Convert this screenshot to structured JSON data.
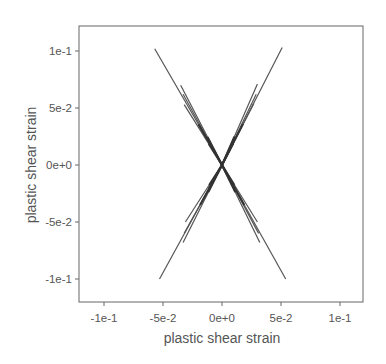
{
  "chart_data": {
    "type": "line",
    "title": "",
    "xlabel": "plastic shear strain",
    "ylabel": "plastic shear strain",
    "xlim": [
      -0.12,
      0.12
    ],
    "ylim": [
      -0.12,
      0.12
    ],
    "xticks": [
      -0.1,
      -0.05,
      0,
      0.05,
      0.1
    ],
    "xtick_labels": [
      "-1e-1",
      "-5e-2",
      "0e+0",
      "5e-2",
      "1e-1"
    ],
    "yticks": [
      -0.1,
      -0.05,
      0,
      0.05,
      0.1
    ],
    "ytick_labels": [
      "-1e-1",
      "-5e-2",
      "0e+0",
      "5e-2",
      "1e-1"
    ],
    "grid": false,
    "legend": null,
    "line_color": "#555555",
    "series": [
      {
        "name": "upper-left long",
        "x": [
          0,
          -0.057
        ],
        "y": [
          0,
          0.102
        ]
      },
      {
        "name": "upper-left 2",
        "x": [
          0,
          -0.035
        ],
        "y": [
          0,
          0.07
        ]
      },
      {
        "name": "upper-left 3",
        "x": [
          0,
          -0.033
        ],
        "y": [
          0,
          0.062
        ]
      },
      {
        "name": "upper-left 4",
        "x": [
          0,
          -0.032
        ],
        "y": [
          0,
          0.053
        ]
      },
      {
        "name": "upper-right long",
        "x": [
          0,
          0.051
        ],
        "y": [
          0,
          0.103
        ]
      },
      {
        "name": "upper-right 2",
        "x": [
          0,
          0.03
        ],
        "y": [
          0,
          0.071
        ]
      },
      {
        "name": "upper-right 3",
        "x": [
          0,
          0.029
        ],
        "y": [
          0,
          0.062
        ]
      },
      {
        "name": "upper-right 4",
        "x": [
          0,
          0.027
        ],
        "y": [
          0,
          0.054
        ]
      },
      {
        "name": "lower-left long",
        "x": [
          0,
          -0.053
        ],
        "y": [
          0,
          -0.1
        ]
      },
      {
        "name": "lower-left 2",
        "x": [
          0,
          -0.031
        ],
        "y": [
          0,
          -0.05
        ]
      },
      {
        "name": "lower-left 3",
        "x": [
          0,
          -0.032
        ],
        "y": [
          0,
          -0.06
        ]
      },
      {
        "name": "lower-left 4",
        "x": [
          0,
          -0.033
        ],
        "y": [
          0,
          -0.068
        ]
      },
      {
        "name": "lower-right long",
        "x": [
          0,
          0.054
        ],
        "y": [
          0,
          -0.1
        ]
      },
      {
        "name": "lower-right 2",
        "x": [
          0,
          0.03
        ],
        "y": [
          0,
          -0.05
        ]
      },
      {
        "name": "lower-right 3",
        "x": [
          0,
          0.031
        ],
        "y": [
          0,
          -0.06
        ]
      },
      {
        "name": "lower-right 4",
        "x": [
          0,
          0.032
        ],
        "y": [
          0,
          -0.068
        ]
      }
    ]
  }
}
